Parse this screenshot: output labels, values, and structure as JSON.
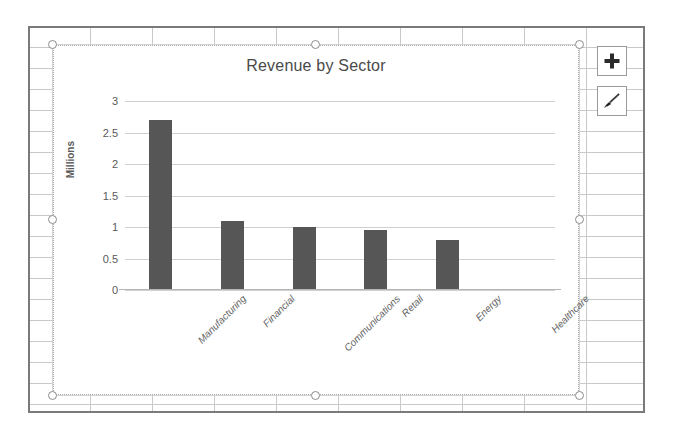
{
  "app": {
    "surface": "spreadsheet-worksheet",
    "grid": {
      "column_width_px": 62,
      "row_height_px": 21
    }
  },
  "chart_object": {
    "selected": true,
    "handle_names": [
      "handle-top-left",
      "handle-top-center",
      "handle-top-right",
      "handle-middle-left",
      "handle-middle-right",
      "handle-bottom-left",
      "handle-bottom-center",
      "handle-bottom-right"
    ]
  },
  "side_buttons": [
    {
      "name": "chart-elements-button",
      "icon": "plus-icon",
      "label": "+"
    },
    {
      "name": "chart-styles-button",
      "icon": "paintbrush-icon",
      "label": ""
    }
  ],
  "chart_data": {
    "type": "bar",
    "title": "Revenue by Sector",
    "xlabel": "",
    "ylabel": "Millions",
    "categories": [
      "Manufacturing",
      "Financial",
      "Communications",
      "Retail",
      "Energy",
      "Healthcare"
    ],
    "values": [
      2.7,
      1.1,
      1.0,
      0.95,
      0.8,
      0.02
    ],
    "ylim": [
      0,
      3
    ],
    "yticks": [
      0,
      0.5,
      1,
      1.5,
      2,
      2.5,
      3
    ],
    "ytick_labels": [
      "0",
      "0.5",
      "1",
      "1.5",
      "2",
      "2.5",
      "3"
    ],
    "grid": true,
    "legend": false,
    "series": [
      {
        "name": "Revenue",
        "values": [
          2.7,
          1.1,
          1.0,
          0.95,
          0.8,
          0.02
        ]
      }
    ],
    "colors": {
      "bar": "#565656",
      "gridline": "#d0d0d0",
      "text": "#5a5a5a",
      "plot_background": "#ffffff"
    }
  }
}
